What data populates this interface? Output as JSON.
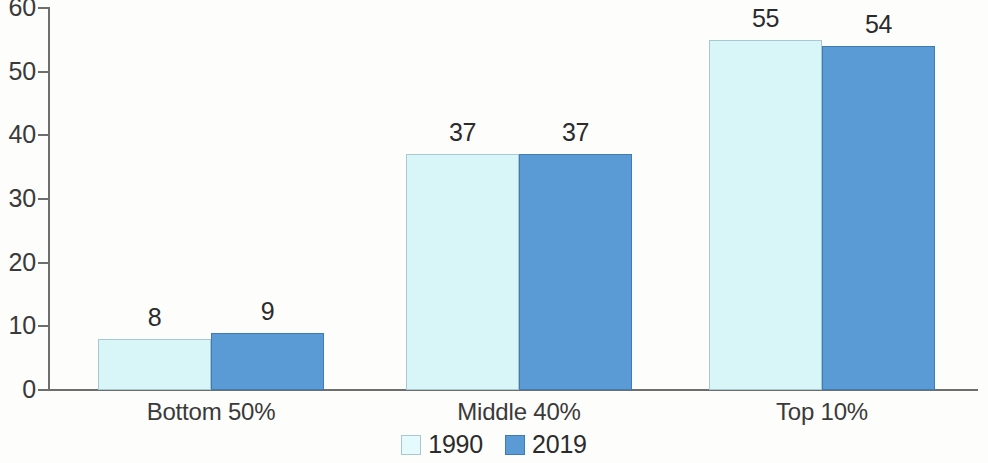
{
  "chart_data": {
    "type": "bar",
    "title": "",
    "subtitle": "",
    "xlabel": "",
    "ylabel": "",
    "categories": [
      "Bottom 50%",
      "Middle 40%",
      "Top 10%"
    ],
    "series": [
      {
        "name": "1990",
        "values": [
          8,
          37,
          55
        ],
        "color": "#d8f5f8"
      },
      {
        "name": "2019",
        "values": [
          9,
          37,
          54
        ],
        "color": "#5b9bd5"
      }
    ],
    "value_labels": [
      [
        "8",
        "37",
        "55"
      ],
      [
        "9",
        "37",
        "54"
      ]
    ],
    "ylim": [
      0,
      60
    ],
    "yticks": [
      0,
      10,
      20,
      30,
      40,
      50,
      60
    ],
    "ytick_labels": [
      "0",
      "10",
      "20",
      "30",
      "40",
      "50",
      "60"
    ],
    "grid": false,
    "legend_position": "bottom-center",
    "legend_entries": [
      "1990",
      "2019"
    ]
  },
  "axis": {
    "y_labels": [
      "60",
      "50",
      "40",
      "30",
      "20",
      "10",
      "0"
    ]
  },
  "legend": {
    "items": [
      {
        "label": "1990"
      },
      {
        "label": "2019"
      }
    ]
  }
}
